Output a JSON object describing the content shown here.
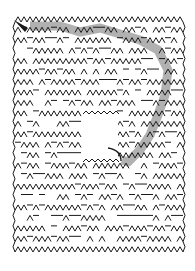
{
  "puzzle": {
    "type": "maze",
    "style": "zigzag-hexagonal",
    "colors": {
      "background": "#ffffff",
      "wall": "#1a1a1a",
      "solution": "#a8a8a8"
    },
    "bounds": {
      "x": 15,
      "y": 22,
      "w": 168,
      "h": 230
    },
    "hole": {
      "x": 83,
      "y": 114,
      "w": 35,
      "h": 48
    },
    "entry_arrow": {
      "x1": 14,
      "y1": 20,
      "x2": 28,
      "y2": 31
    },
    "exit_arrow": {
      "x1": 108,
      "y1": 148,
      "x2": 121,
      "y2": 161
    }
  }
}
